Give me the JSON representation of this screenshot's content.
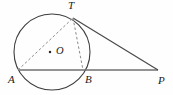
{
  "figure": {
    "kind": "circle-tangent-secant-geometry-diagram",
    "canvas": {
      "width": 173,
      "height": 95,
      "background": "#fefefe"
    },
    "stroke_color": "#3c3c3c",
    "line_color": "#6b6b6b",
    "dash_color": "#8a8a8a",
    "label_color": "#1b1b1b",
    "circle": {
      "cx": 52,
      "cy": 52,
      "r": 38,
      "label": ""
    },
    "center": {
      "name": "center-O",
      "label": "O",
      "dot_x": 50,
      "dot_y": 52,
      "label_x": 56,
      "label_y": 47
    },
    "points": [
      {
        "id": "T",
        "label": "T",
        "x": 73,
        "y": 18,
        "label_x": 68,
        "label_y": 1
      },
      {
        "id": "A",
        "label": "A",
        "x": 18,
        "y": 70,
        "label_x": 8,
        "label_y": 75
      },
      {
        "id": "B",
        "label": "B",
        "x": 83,
        "y": 70,
        "label_x": 84,
        "label_y": 75
      },
      {
        "id": "P",
        "label": "P",
        "x": 158,
        "y": 70,
        "label_x": 158,
        "label_y": 76
      }
    ],
    "segments": [
      {
        "id": "secant-AP",
        "from": "A",
        "to": "P",
        "style": "solid",
        "label": "AP"
      },
      {
        "id": "tangent-TP",
        "from": "T",
        "to": "P",
        "style": "solid",
        "label": "TP"
      },
      {
        "id": "chord-AT",
        "from": "A",
        "to": "T",
        "style": "dashed",
        "label": "AT"
      },
      {
        "id": "chord-TB",
        "from": "T",
        "to": "B",
        "style": "dashed",
        "label": "TB"
      }
    ]
  }
}
